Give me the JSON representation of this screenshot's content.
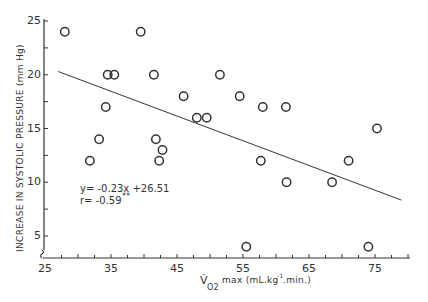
{
  "chart_data": {
    "type": "scatter",
    "title": "",
    "xlabel": "V̇O2 max (mL.kg-1.min.)",
    "ylabel": "INCREASE IN SYSTOLIC PRESSURE (mm Hg)",
    "xlim": [
      25,
      80
    ],
    "ylim": [
      3,
      25
    ],
    "grid": false,
    "legend": null,
    "x_ticks": [
      25,
      35,
      45,
      55,
      65,
      75
    ],
    "y_ticks": [
      5,
      10,
      15,
      20,
      25
    ],
    "points": [
      {
        "x": 28.0,
        "y": 24
      },
      {
        "x": 39.5,
        "y": 24
      },
      {
        "x": 34.5,
        "y": 20
      },
      {
        "x": 35.5,
        "y": 20
      },
      {
        "x": 41.5,
        "y": 20
      },
      {
        "x": 51.5,
        "y": 20
      },
      {
        "x": 46.0,
        "y": 18
      },
      {
        "x": 54.5,
        "y": 18
      },
      {
        "x": 34.2,
        "y": 17
      },
      {
        "x": 58.0,
        "y": 17
      },
      {
        "x": 61.5,
        "y": 17
      },
      {
        "x": 48.0,
        "y": 16
      },
      {
        "x": 49.5,
        "y": 16
      },
      {
        "x": 75.3,
        "y": 15
      },
      {
        "x": 33.2,
        "y": 14
      },
      {
        "x": 41.8,
        "y": 14
      },
      {
        "x": 42.8,
        "y": 13
      },
      {
        "x": 31.8,
        "y": 12
      },
      {
        "x": 42.3,
        "y": 12
      },
      {
        "x": 57.7,
        "y": 12
      },
      {
        "x": 71.0,
        "y": 12
      },
      {
        "x": 61.6,
        "y": 10
      },
      {
        "x": 68.5,
        "y": 10
      },
      {
        "x": 55.5,
        "y": 4
      },
      {
        "x": 74.0,
        "y": 4
      }
    ],
    "regression": {
      "slope": -0.23,
      "intercept": 26.51,
      "x_start": 27,
      "x_end": 79
    },
    "annotations": [
      {
        "text": "y= -0.23x +26.51",
        "x": 31.5,
        "y": 9.2
      },
      {
        "text": "r= -0.59**",
        "x": 31.5,
        "y": 8.1
      }
    ]
  },
  "labels": {
    "y_axis_title": "INCREASE IN SYSTOLIC PRESSURE (mm Hg)",
    "x_axis_symbol": "V̇",
    "x_axis_subscript": "O2",
    "x_axis_rest": "max (mL.kg",
    "x_axis_sup": "-1",
    "x_axis_end": ".min.)",
    "equation": "y= -0.23x +26.51",
    "correlation": "r= -0.59",
    "significance": "**"
  },
  "colors": {
    "ink": "#333333",
    "background": "#ffffff"
  }
}
